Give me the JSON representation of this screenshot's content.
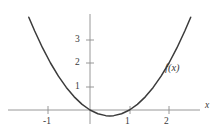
{
  "figure": {
    "background_color": "#ffffff",
    "axis_color": "#8c8c8c",
    "curve_color": "#3b3b3b",
    "text_color": "#3a3a3a",
    "curve_label": "f(x)",
    "x_axis_label": "x",
    "y_axis_label": ""
  },
  "axes": {
    "x_ticks": [
      {
        "value": -1,
        "label": "-1",
        "px": 48
      },
      {
        "value": 1,
        "label": "1",
        "px": 130
      },
      {
        "value": 2,
        "label": "2",
        "px": 169
      }
    ],
    "y_ticks": [
      {
        "value": 1,
        "label": "1",
        "px": 87
      },
      {
        "value": 2,
        "label": "2",
        "px": 63
      },
      {
        "value": 3,
        "label": "3",
        "px": 40
      }
    ],
    "origin_px": {
      "x": 90,
      "y": 110
    },
    "unit_px": {
      "x": 39.5,
      "y": 23.5
    },
    "x_axis_span_px": {
      "start": 8,
      "end": 200
    },
    "y_axis_span_px": {
      "start": 14,
      "end": 124
    }
  },
  "chart_data": {
    "type": "line",
    "title": "",
    "subtitle": "",
    "xlabel": "x",
    "ylabel": "",
    "grid": false,
    "legend": "none",
    "annotations": [
      {
        "text": "f(x)",
        "x": 2.05,
        "y": 1.8
      }
    ],
    "xlim": [
      -1.65,
      2.65
    ],
    "ylim": [
      -0.45,
      3.85
    ],
    "xticks": [
      -1,
      1,
      2
    ],
    "xticklabels": [
      "-1",
      "1",
      "2"
    ],
    "yticks": [
      1,
      2,
      3
    ],
    "yticklabels": [
      "1",
      "2",
      "3"
    ],
    "series": [
      {
        "name": "f(x)",
        "expression": "x^2 - x",
        "vertex": [
          0.5,
          -0.25
        ],
        "roots": [
          0,
          1
        ],
        "x": [
          -1.55,
          -1.4,
          -1.2,
          -1.0,
          -0.8,
          -0.6,
          -0.4,
          -0.2,
          0.0,
          0.2,
          0.4,
          0.5,
          0.6,
          0.8,
          1.0,
          1.2,
          1.4,
          1.6,
          1.8,
          2.0,
          2.2,
          2.4,
          2.55
        ],
        "values": [
          3.95,
          3.36,
          2.64,
          2.0,
          1.44,
          0.96,
          0.56,
          0.24,
          0.0,
          -0.16,
          -0.24,
          -0.25,
          -0.24,
          -0.16,
          0.0,
          0.24,
          0.56,
          0.96,
          1.44,
          2.0,
          2.64,
          3.36,
          3.95
        ]
      }
    ]
  }
}
